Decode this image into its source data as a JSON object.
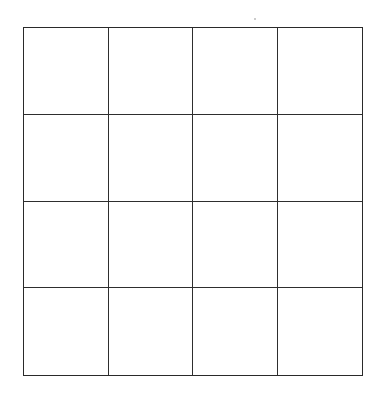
{
  "diagram": {
    "type": "grid",
    "rows": 4,
    "columns": 4,
    "cells": [
      [
        "",
        "",
        "",
        ""
      ],
      [
        "",
        "",
        "",
        ""
      ],
      [
        "",
        "",
        "",
        ""
      ],
      [
        "",
        "",
        "",
        ""
      ]
    ],
    "line_color": "#2e2e2e",
    "background_color": "#ffffff"
  }
}
